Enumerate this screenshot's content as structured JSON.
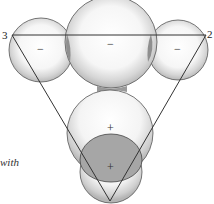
{
  "diagram": {
    "vertex_labels": {
      "left": "3",
      "right": "2"
    },
    "top_signs": {
      "left": "−",
      "center": "−",
      "right": "−"
    },
    "bottom_signs": {
      "upper": "+",
      "lower": "+"
    },
    "caption_fragment": "with",
    "colors": {
      "outline": "#444444",
      "stipple": "#9a9a9a",
      "dark_fill": "#a6a6a6",
      "overlap_fill": "#8f8f8f",
      "background": "#ffffff"
    }
  }
}
